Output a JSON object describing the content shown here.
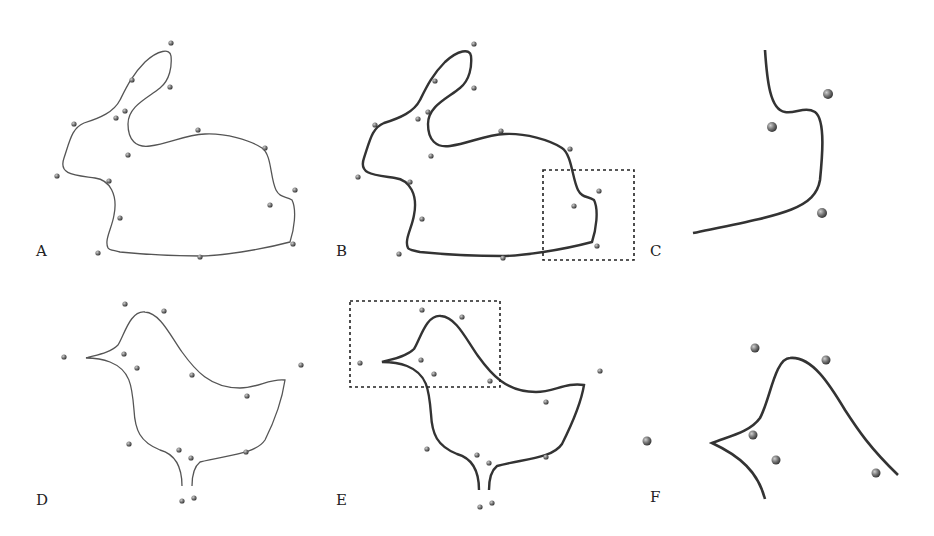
{
  "figure": {
    "panels": [
      {
        "id": "A",
        "label": "A",
        "shape": "rabbit",
        "view": "input curve with control points"
      },
      {
        "id": "B",
        "label": "B",
        "shape": "rabbit",
        "view": "result curve with highlight box"
      },
      {
        "id": "C",
        "label": "C",
        "shape": "rabbit",
        "view": "zoomed detail of B"
      },
      {
        "id": "D",
        "label": "D",
        "shape": "bird",
        "view": "input curve with control points"
      },
      {
        "id": "E",
        "label": "E",
        "shape": "bird",
        "view": "result curve with highlight box"
      },
      {
        "id": "F",
        "label": "F",
        "shape": "bird",
        "view": "zoomed detail of E"
      }
    ],
    "colors": {
      "curve": "#333333",
      "point": "#555555",
      "background": "#ffffff"
    }
  }
}
